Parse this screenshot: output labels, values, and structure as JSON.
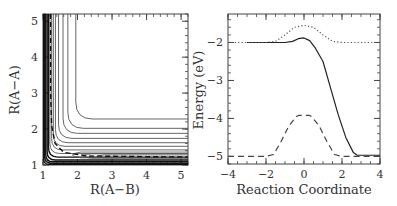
{
  "chart_data": [
    {
      "type": "contour",
      "title": "",
      "xlabel": "R(A−B)",
      "ylabel": "R(A−A)",
      "xlim": [
        1.0,
        5.2
      ],
      "ylim": [
        1.0,
        5.2
      ],
      "xticks": [
        1,
        2,
        3,
        4,
        5
      ],
      "yticks": [
        1,
        2,
        3,
        4,
        5
      ],
      "grid": false,
      "contour_levels_asymptote_y": [
        1.02,
        1.05,
        1.09,
        1.14,
        1.22,
        1.32,
        1.42,
        1.52,
        1.62,
        1.74,
        1.88,
        2.02,
        2.28
      ],
      "contour_levels_asymptote_x": [
        1.02,
        1.05,
        1.08,
        1.12,
        1.16,
        1.2,
        1.25,
        1.3,
        1.36,
        1.45,
        1.58,
        1.72,
        1.95
      ],
      "reaction_path": {
        "style": "dashed",
        "points": [
          [
            1.22,
            5.2
          ],
          [
            1.22,
            3.0
          ],
          [
            1.25,
            2.1
          ],
          [
            1.35,
            1.6
          ],
          [
            1.6,
            1.35
          ],
          [
            2.3,
            1.25
          ],
          [
            5.2,
            1.22
          ]
        ]
      }
    },
    {
      "type": "line",
      "title": "",
      "xlabel": "Reaction Coordinate",
      "ylabel": "Energy (eV)",
      "xlim": [
        -4,
        4
      ],
      "ylim": [
        -5.2,
        -1.25
      ],
      "xticks": [
        -4,
        -2,
        0,
        2,
        4
      ],
      "yticks": [
        -2,
        -3,
        -4,
        -5
      ],
      "grid": false,
      "series": [
        {
          "name": "solid",
          "style": "solid",
          "x": [
            -3,
            -2,
            -1.5,
            -1,
            -0.6,
            -0.3,
            0,
            0.3,
            0.6,
            1.0,
            1.4,
            1.8,
            2.2,
            2.6,
            2.8,
            3.0,
            4.0
          ],
          "y": [
            -2.0,
            -2.0,
            -2.0,
            -2.0,
            -1.97,
            -1.9,
            -1.88,
            -1.95,
            -2.15,
            -2.5,
            -3.2,
            -3.9,
            -4.5,
            -4.9,
            -4.97,
            -4.97,
            -4.97
          ]
        },
        {
          "name": "dotted",
          "style": "dotted",
          "x": [
            -4,
            -2,
            -1.5,
            -1,
            -0.5,
            0,
            0.5,
            1,
            1.5,
            2,
            4
          ],
          "y": [
            -2.0,
            -2.0,
            -1.97,
            -1.8,
            -1.6,
            -1.55,
            -1.6,
            -1.8,
            -1.97,
            -2.0,
            -2.0
          ]
        },
        {
          "name": "dashed",
          "style": "dashed",
          "x": [
            -4,
            -2,
            -1.6,
            -1.2,
            -0.8,
            -0.4,
            -0.3,
            0.3,
            0.4,
            0.8,
            1.2,
            1.6,
            2,
            4
          ],
          "y": [
            -5.0,
            -5.0,
            -4.95,
            -4.6,
            -4.2,
            -3.95,
            -3.92,
            -3.92,
            -3.95,
            -4.2,
            -4.6,
            -4.95,
            -5.0,
            -5.0
          ]
        }
      ]
    }
  ],
  "labels": {
    "left_x": "R(A−B)",
    "left_y": "R(A−A)",
    "right_x": "Reaction Coordinate",
    "right_y": "Energy (eV)"
  }
}
